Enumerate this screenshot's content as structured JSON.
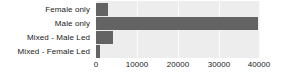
{
  "chart_data": {
    "type": "bar",
    "orientation": "horizontal",
    "title": "",
    "subtitle": "",
    "xlabel": "",
    "ylabel": "",
    "categories": [
      "Female only",
      "Male only",
      "Mixed - Male Led",
      "Mixed - Female Led"
    ],
    "values": [
      3000,
      39500,
      4200,
      1000
    ],
    "series": [
      {
        "name": "",
        "values": [
          3000,
          39500,
          4200,
          1000
        ]
      }
    ],
    "xlim": [
      0,
      40000
    ],
    "xticks": [
      0,
      10000,
      20000,
      30000,
      40000
    ],
    "xtick_labels": [
      "0",
      "10000",
      "20000",
      "30000",
      "40000"
    ],
    "grid": true,
    "grid_axis": "x",
    "legend": false,
    "legend_position": "none",
    "colors": {
      "bar": "#636363",
      "plot_background": "#ededed",
      "page_background": "#ffffff",
      "gridline": "#fbfbfb",
      "text": "#1a1a1a"
    }
  }
}
